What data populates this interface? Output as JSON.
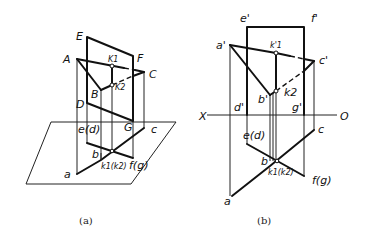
{
  "figure_a": {
    "caption": "(a)",
    "labels": {
      "E": "E",
      "F": "F",
      "A": "A",
      "C": "C",
      "B": "B",
      "D": "D",
      "G": "G",
      "K1": "K1",
      "K2": "K2",
      "a": "a",
      "b": "b",
      "c": "c",
      "ed": "e(d)",
      "fg": "f(g)",
      "k1k2": "k1(k2)"
    }
  },
  "figure_b": {
    "caption": "(b)",
    "labels": {
      "e_prime": "e'",
      "f_prime": "f'",
      "a_prime": "a'",
      "c_prime": "c'",
      "b_prime": "b'",
      "d_prime": "d'",
      "g_prime": "g'",
      "k1_prime": "k'1",
      "k2_prime": "k2",
      "X": "X",
      "O": "O",
      "a": "a",
      "b": "b",
      "c": "c",
      "ed": "e(d)",
      "fg": "f(g)",
      "k1k2": "k1(k2)"
    }
  }
}
